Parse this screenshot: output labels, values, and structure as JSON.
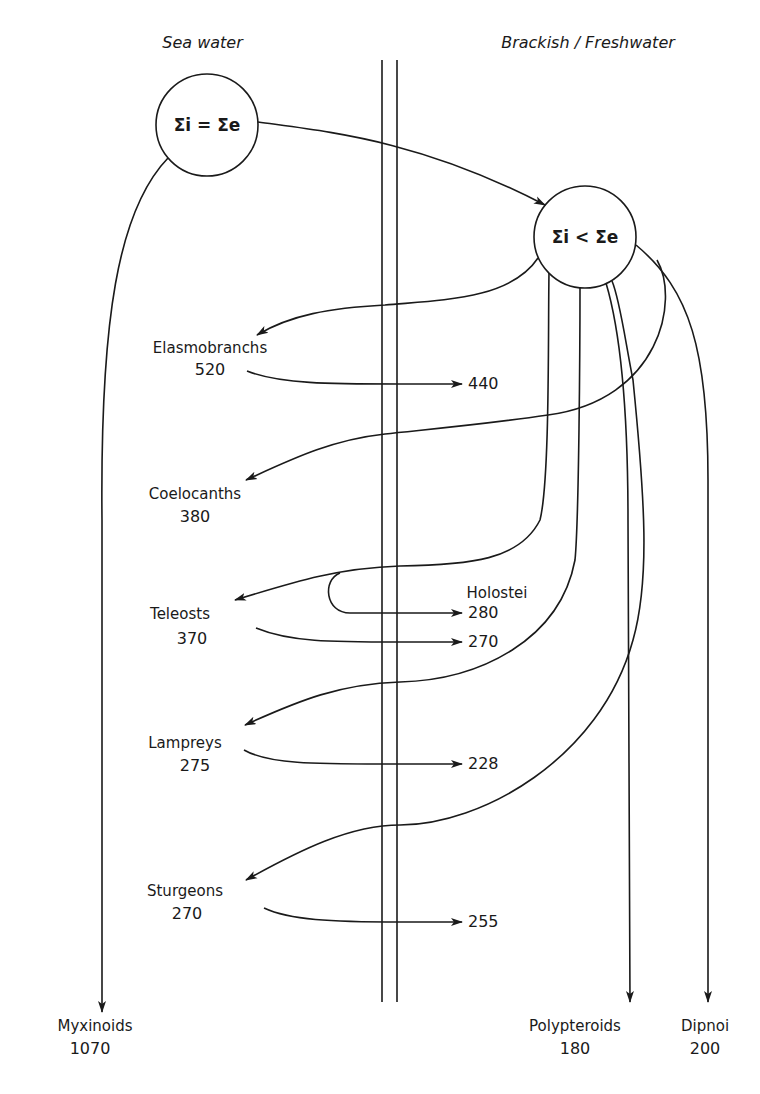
{
  "headers": {
    "left": "Sea water",
    "right": "Brackish / Freshwater"
  },
  "nodes": {
    "marine_state": "Σi = Σe",
    "fresh_state": "Σi < Σe"
  },
  "groups": [
    {
      "name": "Elasmobranchs",
      "marine_value": "520",
      "fresh_value": "440"
    },
    {
      "name": "Coelocanths",
      "marine_value": "380"
    },
    {
      "name": "Teleosts",
      "marine_value": "370",
      "fresh_value": "270"
    },
    {
      "name": "Holostei",
      "fresh_value": "280"
    },
    {
      "name": "Lampreys",
      "marine_value": "275",
      "fresh_value": "228"
    },
    {
      "name": "Sturgeons",
      "marine_value": "270",
      "fresh_value": "255"
    },
    {
      "name": "Myxinoids",
      "marine_value": "1070"
    },
    {
      "name": "Polypteroids",
      "fresh_value": "180"
    },
    {
      "name": "Dipnoi",
      "fresh_value": "200"
    }
  ],
  "style": {
    "line_color": "#1a1a1a",
    "background": "#ffffff"
  }
}
